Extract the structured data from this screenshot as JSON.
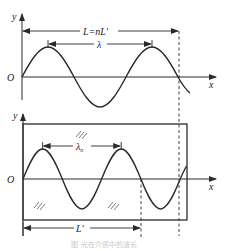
{
  "figure": {
    "top_panel": {
      "y_axis_label": "y",
      "x_axis_label": "x",
      "origin_label": "O",
      "span_label": "L=nL'",
      "wavelength_label": "λ"
    },
    "bottom_panel": {
      "y_axis_label": "y",
      "x_axis_label": "x",
      "origin_label": "O",
      "wavelength_label": "λ",
      "wavelength_subscript": "n",
      "span_label": "L'"
    },
    "caption": "图 光在介质中的波长"
  },
  "colors": {
    "stroke": "#2a2a2a",
    "caption": "#c8c8c8"
  }
}
